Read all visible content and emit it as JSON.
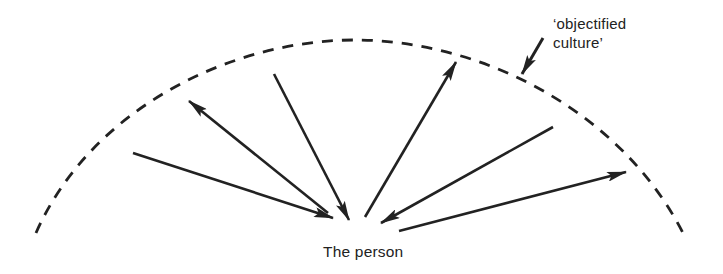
{
  "diagram": {
    "title": "",
    "labels": {
      "culture_line1": "‘objectified",
      "culture_line2": "culture’",
      "person": "The person"
    },
    "colors": {
      "ink": "#222222",
      "background": "#ffffff"
    },
    "boundary": {
      "type": "dashed-arc",
      "represents": "objectified culture",
      "start": [
        36,
        233
      ],
      "apex": [
        355,
        40
      ],
      "end": [
        683,
        233
      ]
    },
    "arrows": [
      {
        "id": "a1",
        "direction": "inward",
        "from": [
          133,
          153
        ],
        "to": [
          333,
          218
        ]
      },
      {
        "id": "a2",
        "direction": "outward",
        "from": [
          328,
          213
        ],
        "to": [
          189,
          101
        ]
      },
      {
        "id": "a3",
        "direction": "inward",
        "from": [
          274,
          74
        ],
        "to": [
          349,
          220
        ]
      },
      {
        "id": "a4",
        "direction": "outward",
        "from": [
          365,
          217
        ],
        "to": [
          456,
          62
        ]
      },
      {
        "id": "a5",
        "direction": "inward",
        "from": [
          553,
          127
        ],
        "to": [
          381,
          223
        ]
      },
      {
        "id": "a6",
        "direction": "outward",
        "from": [
          399,
          231
        ],
        "to": [
          626,
          172
        ]
      }
    ],
    "pointer": {
      "from": [
        543,
        38
      ],
      "to": [
        522,
        74
      ]
    }
  }
}
